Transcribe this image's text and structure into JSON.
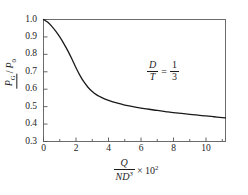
{
  "chart_data": {
    "type": "line",
    "title": "",
    "subtitle": "",
    "xlabel_parts": {
      "numerator": "Q",
      "denominator": "ND",
      "denominator_exp": "3",
      "multiplier": "× 10",
      "multiplier_exp": "2"
    },
    "ylabel_parts": {
      "numerator": "P",
      "numerator_sub": "G",
      "denominator": "P",
      "denominator_sub": "0",
      "text": "P_G/P_0"
    },
    "xlim": [
      0,
      11.2
    ],
    "ylim": [
      0.3,
      1.0
    ],
    "xticks": [
      0,
      2,
      4,
      6,
      8,
      10
    ],
    "xtick_labels": [
      "0",
      "2",
      "4",
      "6",
      "8",
      "10"
    ],
    "xminor_ticks": [
      1,
      3,
      5,
      7,
      9,
      11
    ],
    "yticks": [
      0.3,
      0.4,
      0.5,
      0.6,
      0.7,
      0.8,
      0.9,
      1.0
    ],
    "ytick_labels": [
      "0.3",
      "0.4",
      "0.5",
      "0.6",
      "0.7",
      "0.8",
      "0.9",
      "1.0"
    ],
    "grid": false,
    "legend": null,
    "line_color": "#1a1a1a",
    "axis_color": "#555555",
    "series": [
      {
        "name": "P_G/P_0 vs Q/ND^3",
        "x": [
          0.0,
          0.25,
          0.5,
          0.75,
          1.0,
          1.25,
          1.5,
          1.75,
          2.0,
          2.25,
          2.5,
          2.75,
          3.0,
          3.25,
          3.5,
          3.75,
          4.0,
          4.5,
          5.0,
          5.5,
          6.0,
          6.5,
          7.0,
          7.5,
          8.0,
          8.5,
          9.0,
          9.5,
          10.0,
          10.5,
          11.0,
          11.2
        ],
        "y": [
          1.0,
          0.985,
          0.962,
          0.933,
          0.9,
          0.862,
          0.82,
          0.773,
          0.723,
          0.678,
          0.64,
          0.61,
          0.587,
          0.569,
          0.556,
          0.545,
          0.536,
          0.521,
          0.509,
          0.5,
          0.492,
          0.485,
          0.478,
          0.472,
          0.466,
          0.461,
          0.456,
          0.451,
          0.447,
          0.442,
          0.437,
          0.435
        ]
      }
    ],
    "annotations": [
      {
        "name": "diameter-ratio-annotation",
        "numerator": "D",
        "denominator": "T",
        "equals": "=",
        "value_numerator": "1",
        "value_denominator": "3",
        "text": "D/T = 1/3",
        "x": 7.0,
        "y": 0.715
      }
    ]
  }
}
